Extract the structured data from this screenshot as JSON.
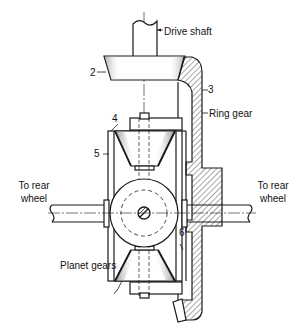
{
  "diagram": {
    "labels": {
      "drive_shaft": "Drive shaft",
      "part_2": "2",
      "part_3": "3",
      "ring_gear": "Ring gear",
      "part_4": "4",
      "part_5": "5",
      "part_6": "6",
      "to_rear_wheel_left_1": "To rear",
      "to_rear_wheel_left_2": "wheel",
      "to_rear_wheel_right_1": "To rear",
      "to_rear_wheel_right_2": "wheel",
      "planet_gears": "Planet gears"
    },
    "colors": {
      "line": "#1a1a1a",
      "background": "#ffffff"
    }
  }
}
